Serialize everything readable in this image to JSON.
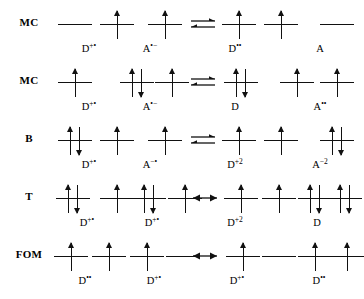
{
  "figure": {
    "type": "orbital-occupancy-diagram",
    "line_color": "#111111",
    "background": "#ffffff"
  },
  "rows": [
    {
      "label": "MC",
      "reaction_arrow": "equilibrium",
      "arrow_x": 188,
      "left_side": [
        {
          "x": 58,
          "electrons": [],
          "label": "",
          "label_sup": ""
        },
        {
          "x": 100,
          "electrons": [
            "up"
          ],
          "label": "D",
          "label_sup": "+•",
          "label_x": 72
        },
        {
          "x": 148,
          "electrons": [
            "up"
          ],
          "label": "A",
          "label_sup": "•−",
          "label_x": 133
        }
      ],
      "right_side": [
        {
          "x": 222,
          "electrons": [
            "up"
          ],
          "label": "",
          "label_sup": ""
        },
        {
          "x": 264,
          "electrons": [
            "up"
          ],
          "label": "D",
          "label_sup": "••",
          "label_x": 218
        },
        {
          "x": 320,
          "electrons": [],
          "label": "A",
          "label_sup": "",
          "label_x": 303
        }
      ]
    },
    {
      "label": "MC",
      "reaction_arrow": "equilibrium",
      "arrow_x": 188,
      "left_side": [
        {
          "x": 58,
          "electrons": [
            "up"
          ],
          "label": "D",
          "label_sup": "+•",
          "label_x": 72
        },
        {
          "x": 120,
          "electrons": [
            "up",
            "down"
          ],
          "label": "",
          "label_sup": ""
        },
        {
          "x": 155,
          "electrons": [
            "up"
          ],
          "label": "A",
          "label_sup": "•−",
          "label_x": 133
        }
      ],
      "right_side": [
        {
          "x": 224,
          "electrons": [
            "up",
            "down"
          ],
          "label": "D",
          "label_sup": "",
          "label_x": 218
        },
        {
          "x": 280,
          "electrons": [
            "up"
          ],
          "label": "",
          "label_sup": ""
        },
        {
          "x": 320,
          "electrons": [
            "up"
          ],
          "label": "A",
          "label_sup": "••",
          "label_x": 303
        }
      ]
    },
    {
      "label": "B",
      "reaction_arrow": "equilibrium",
      "arrow_x": 188,
      "left_side": [
        {
          "x": 58,
          "electrons": [
            "up",
            "down"
          ],
          "label": "D",
          "label_sup": "+•",
          "label_x": 72
        },
        {
          "x": 100,
          "electrons": [
            "up"
          ],
          "label": "",
          "label_sup": ""
        },
        {
          "x": 148,
          "electrons": [
            "up"
          ],
          "label": "A",
          "label_sup": "−•",
          "label_x": 133
        }
      ],
      "right_side": [
        {
          "x": 222,
          "electrons": [
            "up"
          ],
          "label": "",
          "label_sup": ""
        },
        {
          "x": 264,
          "electrons": [
            "up"
          ],
          "label": "D",
          "label_sup": "+2",
          "label_x": 218
        },
        {
          "x": 320,
          "electrons": [
            "up",
            "down"
          ],
          "label": "A",
          "label_sup": "−2",
          "label_x": 303
        }
      ]
    },
    {
      "label": "T",
      "reaction_arrow": "double-headed",
      "arrow_x": 190,
      "left_side": [
        {
          "x": 56,
          "electrons": [
            "up",
            "down"
          ],
          "label": "D",
          "label_sup": "+•",
          "label_x": 70
        },
        {
          "x": 100,
          "electrons": [
            "up"
          ],
          "label": "",
          "label_sup": ""
        },
        {
          "x": 132,
          "electrons": [
            "up",
            "down"
          ],
          "label": "D",
          "label_sup": "+•",
          "label_x": 135
        },
        {
          "x": 168,
          "electrons": [
            "up"
          ],
          "label": "",
          "label_sup": ""
        }
      ],
      "right_side": [
        {
          "x": 224,
          "electrons": [
            "up"
          ],
          "label": "",
          "label_sup": ""
        },
        {
          "x": 262,
          "electrons": [
            "up"
          ],
          "label": "D",
          "label_sup": "+2",
          "label_x": 218
        },
        {
          "x": 298,
          "electrons": [
            "up",
            "down"
          ],
          "label": "",
          "label_sup": ""
        },
        {
          "x": 328,
          "electrons": [
            "up",
            "down"
          ],
          "label": "D",
          "label_sup": "",
          "label_x": 300
        }
      ]
    },
    {
      "label": "FOM",
      "reaction_arrow": "double-headed",
      "arrow_x": 190,
      "left_side": [
        {
          "x": 54,
          "electrons": [
            "up"
          ],
          "label": "D",
          "label_sup": "••",
          "label_x": 68
        },
        {
          "x": 92,
          "electrons": [
            "up"
          ],
          "label": "",
          "label_sup": ""
        },
        {
          "x": 130,
          "electrons": [
            "up"
          ],
          "label": "D",
          "label_sup": "+•",
          "label_x": 137
        },
        {
          "x": 166,
          "electrons": [],
          "label": "",
          "label_sup": ""
        }
      ],
      "right_side": [
        {
          "x": 226,
          "electrons": [
            "up"
          ],
          "label": "D",
          "label_sup": "+•",
          "label_x": 220
        },
        {
          "x": 262,
          "electrons": [],
          "label": "",
          "label_sup": ""
        },
        {
          "x": 298,
          "electrons": [
            "up"
          ],
          "label": "",
          "label_sup": ""
        },
        {
          "x": 330,
          "electrons": [
            "up"
          ],
          "label": "D",
          "label_sup": "••",
          "label_x": 302
        }
      ]
    }
  ],
  "row_tops": [
    4,
    62,
    120,
    178,
    236
  ]
}
